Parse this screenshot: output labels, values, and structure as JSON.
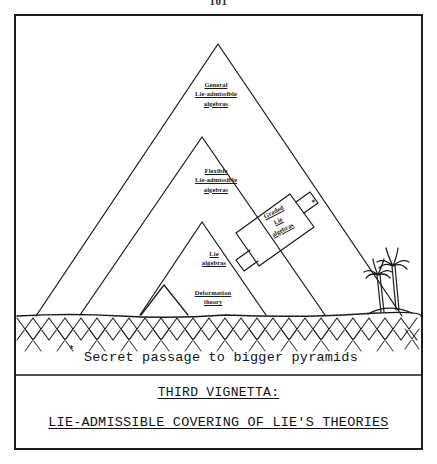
{
  "page": {
    "folio": "101"
  },
  "figure": {
    "pyramid_tiers": [
      {
        "id": "general",
        "lines": [
          "General",
          "Lie-admissible",
          "algebras"
        ]
      },
      {
        "id": "flexible",
        "lines": [
          "Flexible",
          "Lie-admissible",
          "algebras"
        ]
      },
      {
        "id": "lie",
        "lines": [
          "Lie",
          "algebras"
        ]
      },
      {
        "id": "deformation",
        "lines": [
          "Deformation",
          "theory"
        ]
      }
    ],
    "graded_box": {
      "lines": [
        "Graded",
        "Lie",
        "algebras"
      ],
      "marker": "*"
    },
    "scenery": {
      "ground_name": "cross-hatched-sand",
      "palm_count": 2
    }
  },
  "caption": {
    "marker": "*",
    "text": "Secret passage to bigger pyramids"
  },
  "title": {
    "line1": "THIRD VIGNETTA:",
    "line2": "LIE-ADMISSIBLE COVERING OF LIE'S THEORIES"
  },
  "colors": {
    "ink": "#1a1a1a",
    "paper": "#ffffff"
  }
}
